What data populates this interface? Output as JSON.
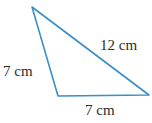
{
  "figure": {
    "type": "triangle",
    "stroke_color": "#3a8fc8",
    "vertices": {
      "top": [
        32,
        7
      ],
      "bottom_left": [
        58,
        96
      ],
      "bottom_right": [
        149,
        95
      ]
    },
    "labels": {
      "left_side": "7 cm",
      "hypotenuse": "12 cm",
      "bottom_side": "7 cm"
    }
  }
}
